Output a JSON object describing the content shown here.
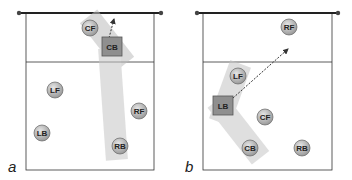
{
  "colors": {
    "court_line": "#333333",
    "net": "#222222",
    "player_fill": "#b8b8b8",
    "setter_fill": "#8f8f8f",
    "zone_fill": "#c8c8c8",
    "arrow": "#333333"
  },
  "panels": [
    {
      "letter": "a",
      "players": [
        {
          "label": "CF",
          "shape": "circle"
        },
        {
          "label": "CB",
          "shape": "square"
        },
        {
          "label": "LF",
          "shape": "circle"
        },
        {
          "label": "RF",
          "shape": "circle"
        },
        {
          "label": "LB",
          "shape": "circle"
        },
        {
          "label": "RB",
          "shape": "circle"
        }
      ]
    },
    {
      "letter": "b",
      "players": [
        {
          "label": "RF",
          "shape": "circle"
        },
        {
          "label": "LF",
          "shape": "circle"
        },
        {
          "label": "LB",
          "shape": "square"
        },
        {
          "label": "CF",
          "shape": "circle"
        },
        {
          "label": "CB",
          "shape": "circle"
        },
        {
          "label": "RB",
          "shape": "circle"
        }
      ]
    }
  ]
}
